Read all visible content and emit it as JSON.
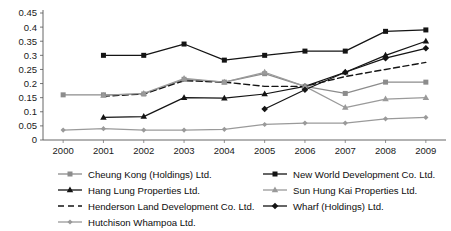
{
  "chart_data": {
    "type": "line",
    "title": "",
    "xlabel": "",
    "ylabel": "",
    "grid": false,
    "legend_position": "bottom",
    "categories": [
      "2000",
      "2001",
      "2002",
      "2003",
      "2004",
      "2005",
      "2006",
      "2007",
      "2008",
      "2009"
    ],
    "x": [
      2000,
      2001,
      2002,
      2003,
      2004,
      2005,
      2006,
      2007,
      2008,
      2009
    ],
    "ylim": [
      0,
      0.45
    ],
    "ytick_labels": [
      "0",
      "0.05",
      "0.1",
      "0.15",
      "0.2",
      "0.25",
      "0.3",
      "0.35",
      "0.4",
      "0.45"
    ],
    "ytick_values": [
      0,
      0.05,
      0.1,
      0.15,
      0.2,
      0.25,
      0.3,
      0.35,
      0.4,
      0.45
    ],
    "series": [
      {
        "name": "Cheung Kong (Holdings) Ltd.",
        "color": "#8c8c8c",
        "marker": "square",
        "dash": "none",
        "values": [
          0.16,
          0.16,
          0.163,
          0.215,
          0.205,
          0.235,
          0.19,
          0.165,
          0.205,
          0.205
        ]
      },
      {
        "name": "Hang Lung Properties Ltd.",
        "color": "#141414",
        "marker": "triangle",
        "dash": "none",
        "values": [
          null,
          0.08,
          0.083,
          0.15,
          0.148,
          0.163,
          0.19,
          0.24,
          0.3,
          0.35
        ]
      },
      {
        "name": "Henderson Land Development Co. Ltd.",
        "color": "#141414",
        "marker": "none",
        "dash": "dashed",
        "values": [
          null,
          0.155,
          0.163,
          0.21,
          0.205,
          0.19,
          0.19,
          0.225,
          0.25,
          0.275
        ]
      },
      {
        "name": "Hutchison Whampoa Ltd.",
        "color": "#9a9a9a",
        "marker": "diamond",
        "dash": "none",
        "values": [
          0.035,
          0.04,
          0.035,
          0.035,
          0.038,
          0.055,
          0.06,
          0.06,
          0.075,
          0.08
        ]
      },
      {
        "name": "New World Development Co. Ltd.",
        "color": "#141414",
        "marker": "filled-square",
        "dash": "none",
        "values": [
          null,
          0.3,
          0.3,
          0.34,
          0.283,
          0.3,
          0.315,
          0.315,
          0.385,
          0.39
        ]
      },
      {
        "name": "Sun Hung Kai Properties Ltd.",
        "color": "#9a9a9a",
        "marker": "triangle",
        "dash": "none",
        "values": [
          null,
          0.158,
          0.165,
          0.218,
          0.205,
          0.24,
          0.19,
          0.115,
          0.145,
          0.15
        ]
      },
      {
        "name": "Wharf (Holdings) Ltd.",
        "color": "#141414",
        "marker": "filled-diamond",
        "dash": "none",
        "values": [
          null,
          null,
          null,
          null,
          null,
          0.11,
          0.178,
          0.24,
          0.29,
          0.325
        ]
      }
    ]
  },
  "legend": {
    "left_items": [
      "Cheung Kong (Holdings) Ltd.",
      "Hang Lung Properties Ltd.",
      "Henderson Land Development Co. Ltd.",
      "Hutchison Whampoa Ltd."
    ],
    "right_items": [
      "New World Development Co. Ltd.",
      "Sun Hung Kai Properties Ltd.",
      "Wharf (Holdings) Ltd."
    ]
  }
}
